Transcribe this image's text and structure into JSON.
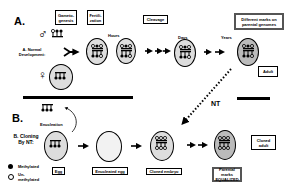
{
  "panel_a": {
    "letter": "A.",
    "row_label": "A. Normal Development:",
    "male_symbol": "♂",
    "female_symbol": "♀",
    "boxes": {
      "gametogenesis": "Gameto-genesis",
      "fertilization": "Fertili-zation",
      "cleavage": "Cleavage",
      "different_marks": "Different marks on parental genomes",
      "adult": "Adult"
    },
    "time_labels": {
      "hours": "Hours",
      "days": "Days",
      "years": "Years"
    }
  },
  "transfer": {
    "label": "NT"
  },
  "panel_b": {
    "letter": "B.",
    "row_label": "B. Cloning By NT:",
    "enucleation": "Enucleation",
    "boxes": {
      "egg": "Egg",
      "enucleated_egg": "Enucleated egg",
      "cloned_embryo": "Cloned embryo",
      "parental_marks": "Parental marks EQUALIZED",
      "cloned_adult": "Cloned adult"
    }
  },
  "legend": {
    "methylated": "Methylated",
    "unmethylated": "Un-methylated"
  }
}
